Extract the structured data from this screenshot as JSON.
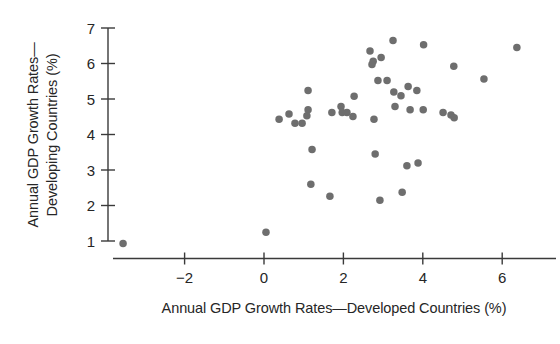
{
  "chart_data": {
    "type": "scatter",
    "title": "",
    "xlabel": "Annual GDP Growth Rates—Developed Countries (%)",
    "ylabel_line1": "Annual GDP Growth Rates—",
    "ylabel_line2": "Developing Countries (%)",
    "xlim": [
      -3.95,
      7.45
    ],
    "ylim": [
      0.5,
      7.35
    ],
    "xticks": [
      -2,
      0,
      2,
      4,
      6
    ],
    "xticklabels": [
      "−2",
      "0",
      "2",
      "4",
      "6"
    ],
    "yticks": [
      1,
      2,
      3,
      4,
      5,
      6,
      7
    ],
    "yticklabels": [
      "1",
      "2",
      "3",
      "4",
      "5",
      "6",
      "7"
    ],
    "grid": false,
    "legend": null,
    "marker": {
      "shape": "circle",
      "color": "#6e6e6e",
      "size_px": 7.5
    },
    "axis_color": "#3a3a3a",
    "background": "#ffffff",
    "points": [
      {
        "x": -3.55,
        "y": 0.93
      },
      {
        "x": 0.05,
        "y": 1.25
      },
      {
        "x": 0.38,
        "y": 4.43
      },
      {
        "x": 0.63,
        "y": 4.58
      },
      {
        "x": 0.78,
        "y": 4.32
      },
      {
        "x": 1.11,
        "y": 5.24
      },
      {
        "x": 1.11,
        "y": 4.7
      },
      {
        "x": 1.08,
        "y": 4.53
      },
      {
        "x": 0.96,
        "y": 4.32
      },
      {
        "x": 1.21,
        "y": 3.58
      },
      {
        "x": 1.18,
        "y": 2.6
      },
      {
        "x": 1.71,
        "y": 4.62
      },
      {
        "x": 1.94,
        "y": 4.79
      },
      {
        "x": 1.97,
        "y": 4.62
      },
      {
        "x": 2.09,
        "y": 4.62
      },
      {
        "x": 1.66,
        "y": 2.26
      },
      {
        "x": 2.27,
        "y": 5.08
      },
      {
        "x": 2.67,
        "y": 6.35
      },
      {
        "x": 3.25,
        "y": 6.65
      },
      {
        "x": 2.75,
        "y": 6.06
      },
      {
        "x": 2.95,
        "y": 6.17
      },
      {
        "x": 2.72,
        "y": 5.97
      },
      {
        "x": 2.87,
        "y": 5.52
      },
      {
        "x": 3.1,
        "y": 5.52
      },
      {
        "x": 3.27,
        "y": 5.2
      },
      {
        "x": 3.45,
        "y": 5.09
      },
      {
        "x": 3.63,
        "y": 5.35
      },
      {
        "x": 3.85,
        "y": 5.24
      },
      {
        "x": 3.3,
        "y": 4.79
      },
      {
        "x": 3.68,
        "y": 4.7
      },
      {
        "x": 2.24,
        "y": 4.51
      },
      {
        "x": 2.77,
        "y": 4.43
      },
      {
        "x": 2.8,
        "y": 3.45
      },
      {
        "x": 3.6,
        "y": 3.12
      },
      {
        "x": 3.88,
        "y": 3.2
      },
      {
        "x": 2.92,
        "y": 2.15
      },
      {
        "x": 3.48,
        "y": 2.37
      },
      {
        "x": 4.02,
        "y": 6.53
      },
      {
        "x": 4.78,
        "y": 5.92
      },
      {
        "x": 5.54,
        "y": 5.56
      },
      {
        "x": 6.37,
        "y": 6.45
      },
      {
        "x": 4.01,
        "y": 4.7
      },
      {
        "x": 4.51,
        "y": 4.62
      },
      {
        "x": 4.71,
        "y": 4.55
      },
      {
        "x": 4.79,
        "y": 4.47
      }
    ]
  },
  "axes": {
    "x_axis_name": "x-axis",
    "y_axis_name": "y-axis"
  }
}
